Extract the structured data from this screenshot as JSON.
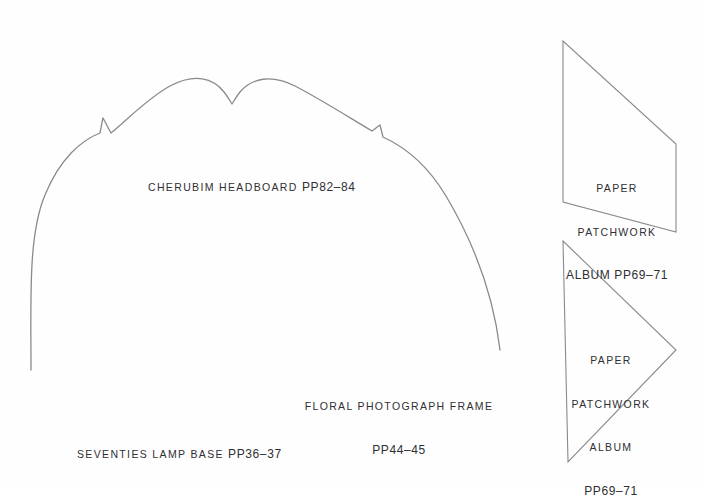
{
  "page": {
    "background_color": "#fefefe",
    "line_color": "#8a8a8e",
    "text_color": "#2f2f33",
    "width": 702,
    "height": 489,
    "top_bleed_text": "· ·· ···· ··· ····"
  },
  "captions": [
    {
      "id": "cherubim-headboard",
      "lines": [
        "CHERUBIM HEADBOARD ",
        "PP82–84"
      ],
      "full_text": "CHERUBIM HEADBOARD PP82–84",
      "align": "left",
      "x": 148,
      "y": 151
    },
    {
      "id": "paper-patchwork-album-top",
      "lines": [
        "PAPER",
        "PATCHWORK",
        "ALBUM PP69–71"
      ],
      "full_text": "PAPER PATCHWORK ALBUM PP69–71",
      "align": "center",
      "x": 617,
      "y": 152
    },
    {
      "id": "floral-photograph-frame",
      "lines": [
        "FLORAL PHOTOGRAPH FRAME",
        "PP44–45"
      ],
      "full_text": "FLORAL PHOTOGRAPH FRAME PP44–45",
      "align": "center",
      "x": 399,
      "y": 370
    },
    {
      "id": "paper-patchwork-album-bottom",
      "lines": [
        "PAPER",
        "PATCHWORK",
        "ALBUM",
        "PP69–71"
      ],
      "full_text": "PAPER PATCHWORK ALBUM PP69–71",
      "align": "center",
      "x": 611,
      "y": 324
    },
    {
      "id": "seventies-lamp-base",
      "lines": [
        "SEVENTIES LAMP BASE ",
        "PP36–37"
      ],
      "full_text": "SEVENTIES LAMP BASE PP36–37",
      "align": "left",
      "x": 77,
      "y": 418
    }
  ],
  "shapes": [
    {
      "id": "cherubim-headboard-outline",
      "name": "scalloped-headboard-template",
      "stroke": "#8a8a8e",
      "stroke_width": 1.3,
      "fill": "none",
      "path": "M 31,370 C 31,300 28,235 45,195 C 60,158 82,140 100,133 C 101,128 102,122 103,118 C 107,125 109,130 111,133 C 128,119 148,98 170,86 C 195,73 213,78 224,92 C 228,97 230,101 232,104 C 234,101 236,97 240,92 C 252,78 271,74 295,86 C 322,100 350,118 372,131 C 375,129 377,127 380,125 C 381,129 382,133 383,137 C 405,147 428,166 446,196 C 468,233 492,283 500,350"
    },
    {
      "id": "paper-patchwork-top-shape",
      "name": "paper-patchwork-album-template-top",
      "stroke": "#8a8a8e",
      "stroke_width": 1.1,
      "fill": "none",
      "path": "M 563,41 L 563,202 L 676,232 L 676,144 Z"
    },
    {
      "id": "paper-patchwork-bottom-shape",
      "name": "paper-patchwork-album-template-bottom",
      "stroke": "#8a8a8e",
      "stroke_width": 1.1,
      "fill": "none",
      "path": "M 563,241 L 676,350 L 568,462 Z"
    }
  ]
}
